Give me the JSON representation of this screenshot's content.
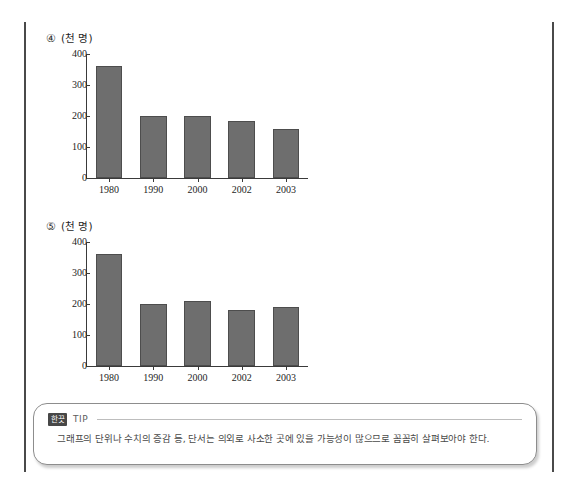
{
  "page": {
    "background_color": "#ffffff",
    "rule_color": "#4a4a4a"
  },
  "chart_data": [
    {
      "id": "chart-4",
      "type": "bar",
      "marker": "④",
      "title": "",
      "unit_label": "(천 명)",
      "ylabel": "(천 명)",
      "xlabel": "",
      "categories": [
        "1980",
        "1990",
        "2000",
        "2002",
        "2003"
      ],
      "values": [
        360,
        200,
        200,
        185,
        157
      ],
      "yticks": [
        0,
        100,
        200,
        300,
        400
      ],
      "ylim": [
        0,
        400
      ],
      "grid": false,
      "legend": "none",
      "bar_color": "#6e6e6e"
    },
    {
      "id": "chart-5",
      "type": "bar",
      "marker": "⑤",
      "title": "",
      "unit_label": "(천 명)",
      "ylabel": "(천 명)",
      "xlabel": "",
      "categories": [
        "1980",
        "1990",
        "2000",
        "2002",
        "2003"
      ],
      "values": [
        360,
        200,
        210,
        180,
        190
      ],
      "yticks": [
        0,
        100,
        200,
        300,
        400
      ],
      "ylim": [
        0,
        400
      ],
      "grid": false,
      "legend": "none",
      "bar_color": "#6e6e6e"
    }
  ],
  "tip": {
    "badge": "한끗",
    "label": "TIP",
    "body": "그래프의 단위나 수치의 증감 등, 단서는 의외로 사소한 곳에 있을 가능성이 많으므로 꼼꼼히 살펴보아야 한다."
  }
}
